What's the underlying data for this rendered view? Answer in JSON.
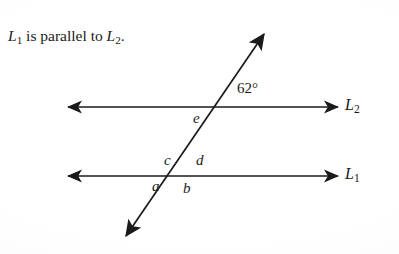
{
  "figure": {
    "caption": {
      "prefix_var": "L",
      "prefix_sub": "1",
      "middle_text": " is parallel to ",
      "suffix_var": "L",
      "suffix_sub": "2",
      "terminator": ".",
      "full_text": "L1 is parallel to L2."
    },
    "background_color": "#fdfdfd",
    "stroke_color": "#1a1a1a",
    "lines": [
      {
        "id": "L2",
        "label_var": "L",
        "label_sub": "2",
        "label_text": "L2",
        "orientation": "horizontal",
        "y": 107,
        "x_start": 68,
        "x_end": 338,
        "arrows": "both"
      },
      {
        "id": "L1",
        "label_var": "L",
        "label_sub": "1",
        "label_text": "L1",
        "orientation": "horizontal",
        "y": 176,
        "x_start": 68,
        "x_end": 338,
        "arrows": "both"
      },
      {
        "id": "transversal",
        "label_var": "",
        "label_sub": "",
        "label_text": "",
        "orientation": "diagonal",
        "x_start": 126,
        "y_start": 236,
        "x_end": 264,
        "y_end": 34,
        "arrows": "both"
      }
    ],
    "intersections": [
      {
        "id": "upper",
        "on_line": "L2",
        "x": 207,
        "y": 107,
        "labels": [
          {
            "name": "angle-62",
            "text": "62°",
            "position": "upper-right",
            "type": "measure"
          },
          {
            "name": "angle-e",
            "text": "e",
            "position": "lower-left",
            "type": "variable"
          }
        ]
      },
      {
        "id": "lower",
        "on_line": "L1",
        "x": 180,
        "y": 176,
        "labels": [
          {
            "name": "angle-c",
            "text": "c",
            "position": "upper-left",
            "type": "variable"
          },
          {
            "name": "angle-d",
            "text": "d",
            "position": "upper-right",
            "type": "variable"
          },
          {
            "name": "angle-a",
            "text": "a",
            "position": "lower-left",
            "type": "variable"
          },
          {
            "name": "angle-b",
            "text": "b",
            "position": "lower-right",
            "type": "variable"
          }
        ]
      }
    ],
    "angle_labels": {
      "measure_62": "62°",
      "e": "e",
      "c": "c",
      "d": "d",
      "a": "a",
      "b": "b"
    }
  }
}
